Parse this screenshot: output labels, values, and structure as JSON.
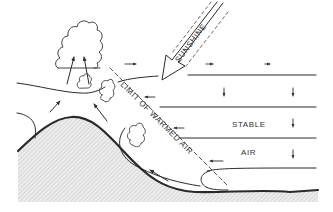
{
  "diagram": {
    "title": "",
    "labels": {
      "sunshine": "SUNSHINE",
      "limit": "LIMIT OF WARMED AIR",
      "stable": "STABLE",
      "air": "AIR"
    },
    "colors": {
      "ink": "#2a2a2a",
      "ground_fill": "#e4e4e4",
      "ground_hatch": "#bdbdbd",
      "background": "#ffffff"
    },
    "icons": [
      "cloud-icon",
      "sunshine-arrow-icon",
      "air-flow-arrow-icon"
    ]
  }
}
